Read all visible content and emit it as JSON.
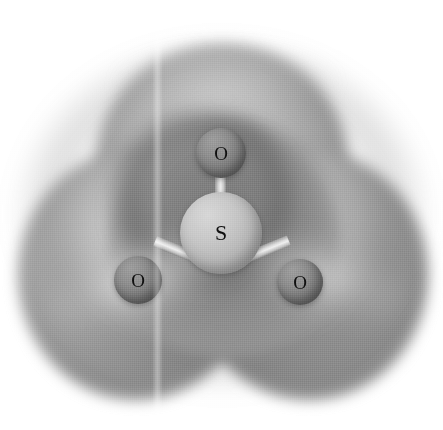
{
  "figure": {
    "kind": "molecular-model",
    "background_color": "#ffffff",
    "width": 443,
    "height": 430,
    "has_visible_text_caption": false
  },
  "molecule": {
    "formula": "SO3",
    "geometry": "trigonal planar",
    "atoms": [
      {
        "id": "s-center",
        "label": "S",
        "element": "sulfur",
        "color": "#bdbdbd",
        "x": 221,
        "y": 233,
        "radius": 41
      },
      {
        "id": "o-top",
        "label": "O",
        "element": "oxygen",
        "color": "#858585",
        "x": 221,
        "y": 153,
        "radius": 25
      },
      {
        "id": "o-left",
        "label": "O",
        "element": "oxygen",
        "color": "#858585",
        "x": 138,
        "y": 280,
        "radius": 24
      },
      {
        "id": "o-right",
        "label": "O",
        "element": "oxygen",
        "color": "#858585",
        "x": 300,
        "y": 282,
        "radius": 23
      }
    ],
    "bonds": [
      {
        "id": "bond-s-o-top",
        "from": "s-center",
        "to": "o-top",
        "color": "#e0e0e0"
      },
      {
        "id": "bond-s-o-left",
        "from": "s-center",
        "to": "o-left",
        "color": "#e0e0e0"
      },
      {
        "id": "bond-s-o-right",
        "from": "s-center",
        "to": "o-right",
        "color": "#e0e0e0"
      }
    ]
  },
  "isosurface": {
    "name": "electron-density-isosurface",
    "style": "semi-transparent shaded lobes",
    "lobe_count": 3,
    "surface_color_light": "#c6c6c6",
    "surface_color_mid": "#a8a8a8",
    "surface_color_shadow": "#7f7f7f",
    "interior_cavity_color": "#7e7e7e"
  },
  "artifacts": {
    "scan_seam": {
      "name": "page-fold-seam",
      "orientation": "vertical",
      "x": 157
    }
  }
}
